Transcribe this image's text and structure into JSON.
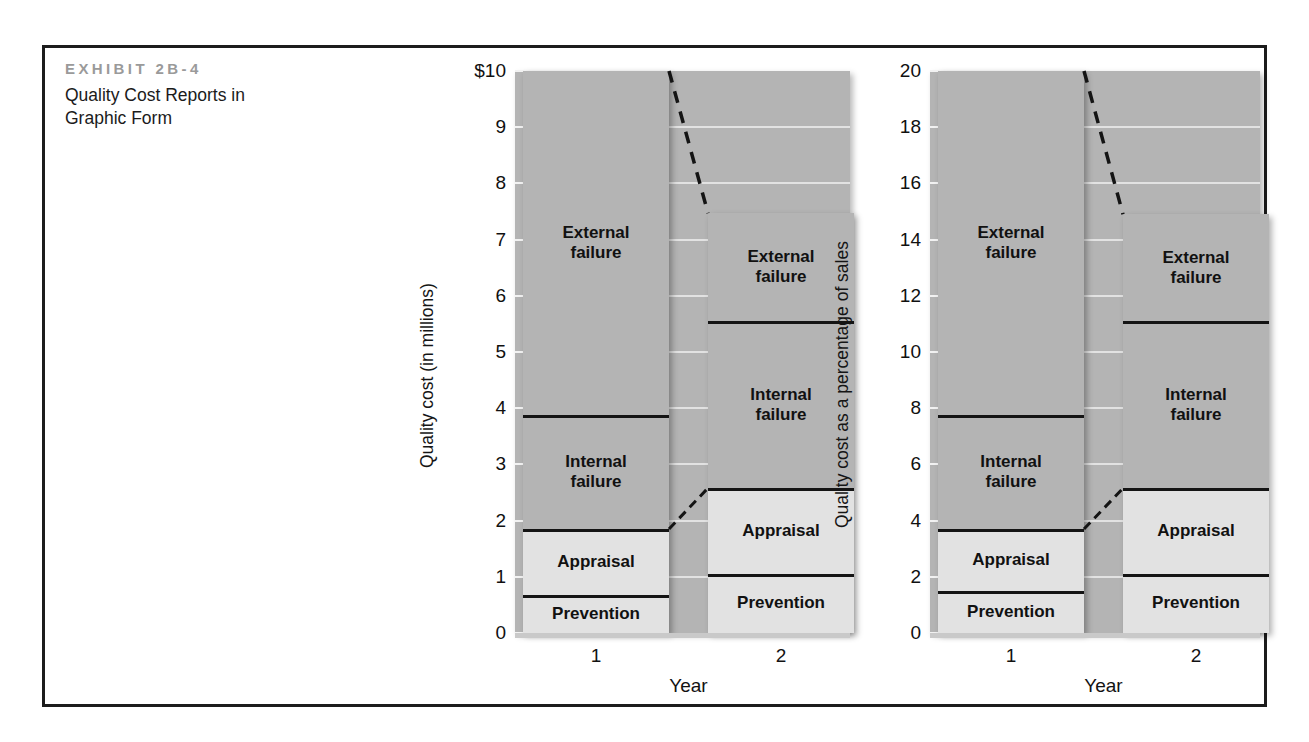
{
  "exhibit": {
    "label": "EXHIBIT 2B-4",
    "title": "Quality Cost Reports in Graphic Form"
  },
  "colors": {
    "frame": "#1c1c1c",
    "plot_background": "#b4b4b4",
    "dark_segment": "#b4b4b4",
    "light_segment": "#e2e2e2",
    "gridline": "#eaeaea",
    "boundary_line": "#141414",
    "label_gray": "#9a9a9a"
  },
  "chart_data": [
    {
      "type": "bar",
      "title": "",
      "stacked": true,
      "xlabel": "Year",
      "ylabel": "Quality cost (in millions)",
      "categories": [
        "1",
        "2"
      ],
      "ylim": [
        0,
        10
      ],
      "yticks": [
        0,
        1,
        2,
        3,
        4,
        5,
        6,
        7,
        8,
        9,
        10
      ],
      "ytick_labels": [
        "0",
        "1",
        "2",
        "3",
        "4",
        "5",
        "6",
        "7",
        "8",
        "9",
        "$10"
      ],
      "grid": true,
      "legend": "inline-segment-labels",
      "series": [
        {
          "name": "Prevention",
          "values": [
            0.68,
            1.05
          ]
        },
        {
          "name": "Appraisal",
          "values": [
            1.85,
            2.58
          ]
        },
        {
          "name": "Internal failure",
          "values": [
            3.88,
            5.55
          ]
        },
        {
          "name": "External failure",
          "values": [
            10.0,
            7.47
          ]
        }
      ],
      "segments": [
        {
          "name": "Prevention",
          "year1": {
            "bottom": 0,
            "top": 0.68
          },
          "year2": {
            "bottom": 0,
            "top": 1.05
          }
        },
        {
          "name": "Appraisal",
          "year1": {
            "bottom": 0.68,
            "top": 1.85
          },
          "year2": {
            "bottom": 1.05,
            "top": 2.58
          }
        },
        {
          "name": "Internal failure",
          "year1": {
            "bottom": 1.85,
            "top": 3.88
          },
          "year2": {
            "bottom": 2.58,
            "top": 5.55
          }
        },
        {
          "name": "External failure",
          "year1": {
            "bottom": 3.88,
            "top": 10.0
          },
          "year2": {
            "bottom": 5.55,
            "top": 7.47
          }
        }
      ],
      "trend_annotation": {
        "style": "dashed",
        "from": [
          10.0,
          1
        ],
        "to": [
          7.47,
          2
        ]
      }
    },
    {
      "type": "bar",
      "title": "",
      "stacked": true,
      "xlabel": "Year",
      "ylabel": "Quality cost as a percentage of sales",
      "categories": [
        "1",
        "2"
      ],
      "ylim": [
        0,
        20
      ],
      "yticks": [
        0,
        2,
        4,
        6,
        8,
        10,
        12,
        14,
        16,
        18,
        20
      ],
      "ytick_labels": [
        "0",
        "2",
        "4",
        "6",
        "8",
        "10",
        "12",
        "14",
        "16",
        "18",
        "20"
      ],
      "grid": true,
      "legend": "inline-segment-labels",
      "series": [
        {
          "name": "Prevention",
          "values": [
            1.5,
            2.1
          ]
        },
        {
          "name": "Appraisal",
          "values": [
            3.7,
            5.15
          ]
        },
        {
          "name": "Internal failure",
          "values": [
            7.75,
            11.1
          ]
        },
        {
          "name": "External failure",
          "values": [
            20.0,
            14.9
          ]
        }
      ],
      "segments": [
        {
          "name": "Prevention",
          "year1": {
            "bottom": 0,
            "top": 1.5
          },
          "year2": {
            "bottom": 0,
            "top": 2.1
          }
        },
        {
          "name": "Appraisal",
          "year1": {
            "bottom": 1.5,
            "top": 3.7
          },
          "year2": {
            "bottom": 2.1,
            "top": 5.15
          }
        },
        {
          "name": "Internal failure",
          "year1": {
            "bottom": 3.7,
            "top": 7.75
          },
          "year2": {
            "bottom": 5.15,
            "top": 11.1
          }
        },
        {
          "name": "External failure",
          "year1": {
            "bottom": 7.75,
            "top": 20.0
          },
          "year2": {
            "bottom": 11.1,
            "top": 14.9
          }
        }
      ],
      "trend_annotation": {
        "style": "dashed",
        "from": [
          20.0,
          1
        ],
        "to": [
          14.9,
          2
        ]
      }
    }
  ]
}
